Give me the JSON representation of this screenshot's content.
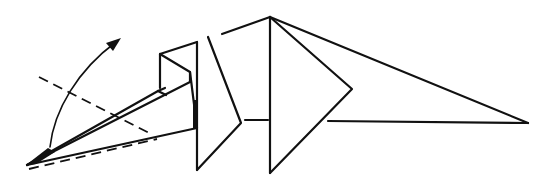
{
  "diagram": {
    "type": "origami-fold-step",
    "background": "#ffffff",
    "stroke_color": "#111111",
    "elements": [
      {
        "name": "fold-arrow",
        "kind": "curved-arrow",
        "direction": "up-right"
      },
      {
        "name": "valley-fold-line",
        "kind": "dashed-line"
      },
      {
        "name": "hidden-edge-line",
        "kind": "dashed-line"
      },
      {
        "name": "pointed-flap",
        "kind": "outline"
      },
      {
        "name": "box-layer",
        "kind": "outline"
      },
      {
        "name": "front-flap",
        "kind": "outline"
      },
      {
        "name": "center-body",
        "kind": "outline"
      },
      {
        "name": "tail-triangle",
        "kind": "outline"
      }
    ]
  }
}
